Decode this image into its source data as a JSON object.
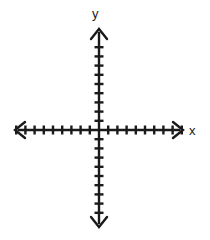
{
  "figure": {
    "title": "",
    "background_color": "#ffffff",
    "stroke_color": "#1a1a1a",
    "width": 210,
    "height": 240
  },
  "labels": {
    "y_axis": "y",
    "x_axis": "x"
  },
  "chart_data": {
    "type": "scatter",
    "title": "",
    "subtitle": "",
    "xlabel": "x",
    "ylabel": "y",
    "series": [],
    "x": [],
    "values": [],
    "categories": [],
    "grid": false,
    "legend": false,
    "legend_position": "none",
    "tick_labels_shown": false,
    "xlim": [
      -9,
      9
    ],
    "ylim": [
      -9,
      9
    ],
    "tick_interval": 1,
    "ticks": {
      "x_positive_count": 9,
      "x_negative_count": 9,
      "y_positive_count": 9,
      "y_negative_count": 9,
      "spacing_px": 9.2,
      "length_px": 9
    },
    "axes": {
      "origin_px": [
        99,
        130
      ],
      "x_left_tip_px": [
        14,
        130
      ],
      "x_right_tip_px": [
        184,
        130
      ],
      "y_top_tip_px": [
        99,
        28
      ],
      "y_bottom_tip_px": [
        99,
        228
      ],
      "arrowheads": [
        "left",
        "right",
        "up",
        "down"
      ],
      "stroke_width_px": 2.4
    }
  }
}
